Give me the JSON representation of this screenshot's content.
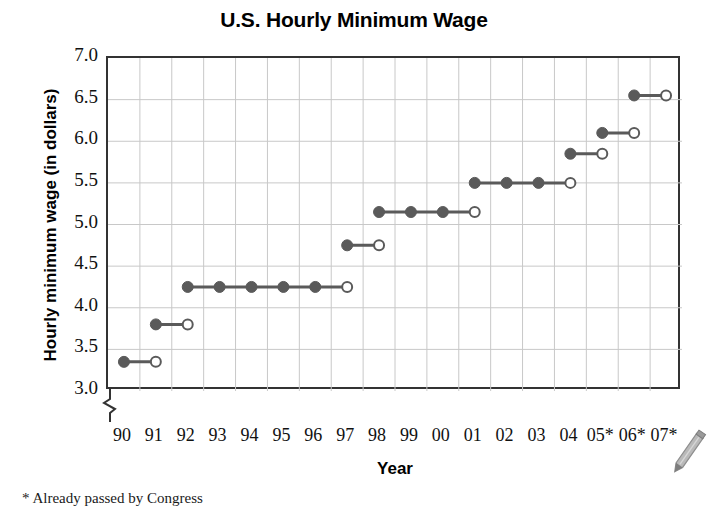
{
  "chart_data": {
    "type": "line",
    "subtype": "step",
    "title": "U.S. Hourly Minimum Wage",
    "xlabel": "Year",
    "ylabel": "Hourly minimum wage (in dollars)",
    "footnote": "* Already passed by Congress",
    "ylim": [
      3.0,
      7.0
    ],
    "yticks": [
      "7.0",
      "6.5",
      "6.0",
      "5.5",
      "5.0",
      "4.5",
      "4.0",
      "3.5",
      "3.0"
    ],
    "ytick_values": [
      7.0,
      6.5,
      6.0,
      5.5,
      5.0,
      4.5,
      4.0,
      3.5,
      3.0
    ],
    "xticks": [
      "90",
      "91",
      "92",
      "93",
      "94",
      "95",
      "96",
      "97",
      "98",
      "99",
      "00",
      "01",
      "02",
      "03",
      "04",
      "05*",
      "06*",
      "07*"
    ],
    "x_values": [
      1990,
      1991,
      1992,
      1993,
      1994,
      1995,
      1996,
      1997,
      1998,
      1999,
      2000,
      2001,
      2002,
      2003,
      2004,
      2005,
      2006,
      2007
    ],
    "grid": true,
    "legend": "none",
    "y_axis_break": true,
    "series": [
      {
        "name": "U.S. hourly minimum wage",
        "values": [
          3.35,
          3.8,
          4.25,
          4.25,
          4.25,
          4.25,
          4.25,
          4.75,
          5.15,
          5.15,
          5.15,
          5.5,
          5.5,
          5.5,
          5.85,
          6.1,
          6.55,
          6.55
        ],
        "color": "#5a5a5a"
      }
    ],
    "steps": [
      {
        "label": "1990",
        "start_year": 1990,
        "end_year": 1991,
        "value": 3.35
      },
      {
        "label": "1991",
        "start_year": 1991,
        "end_year": 1992,
        "value": 3.8
      },
      {
        "label": "1992-1996",
        "start_year": 1992,
        "end_year": 1997,
        "value": 4.25
      },
      {
        "label": "1997",
        "start_year": 1997,
        "end_year": 1998,
        "value": 4.75
      },
      {
        "label": "1998-2000",
        "start_year": 1998,
        "end_year": 2001,
        "value": 5.15
      },
      {
        "label": "2001-2003",
        "start_year": 2001,
        "end_year": 2004,
        "value": 5.5
      },
      {
        "label": "2004",
        "start_year": 2004,
        "end_year": 2005,
        "value": 5.85
      },
      {
        "label": "2005*",
        "start_year": 2005,
        "end_year": 2006,
        "value": 6.1
      },
      {
        "label": "2006*",
        "start_year": 2006,
        "end_year": 2007,
        "value": 6.55
      }
    ],
    "colors": {
      "marker": "#5a5a5a",
      "line": "#5a5a5a",
      "grid": "#c8c8c8",
      "frame": "#333333",
      "text": "#111111",
      "background": "#ffffff"
    }
  }
}
